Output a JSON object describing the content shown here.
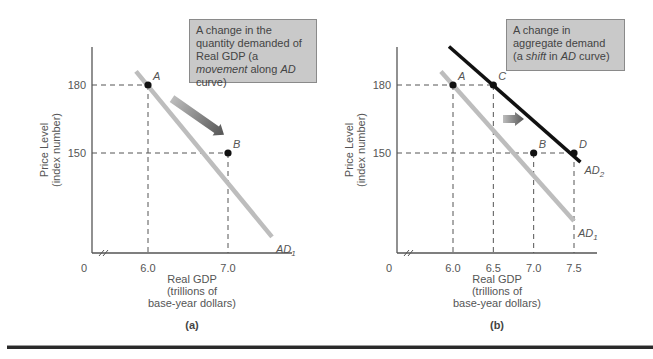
{
  "chart_data": [
    {
      "type": "line",
      "panel_label": "(a)",
      "annotation": {
        "pre": "A change in the quantity demanded of Real GDP (a ",
        "em": "movement",
        "mid": " along ",
        "em2": "AD",
        "post": " curve)"
      },
      "ylabel_line1": "Price Level",
      "ylabel_line2": "(index number)",
      "xlabel_line1": "Real GDP",
      "xlabel_line2": "(trillions of",
      "xlabel_line3": "base-year dollars)",
      "origin_label": "0",
      "x_ticks": [
        "6.0",
        "7.0"
      ],
      "x_tick_values": [
        6.0,
        7.0
      ],
      "y_ticks": [
        "180",
        "150"
      ],
      "y_tick_values": [
        180,
        150
      ],
      "series": [
        {
          "name": "AD1",
          "label_main": "AD",
          "label_sub": "1",
          "color": "#bdbdbd",
          "x": [
            5.85,
            7.55
          ],
          "y": [
            186,
            113
          ]
        }
      ],
      "points": [
        {
          "label": "A",
          "x": 6.0,
          "y": 180
        },
        {
          "label": "B",
          "x": 7.0,
          "y": 150
        }
      ],
      "arrow": {
        "from": [
          6.3,
          174
        ],
        "to": [
          6.95,
          158
        ],
        "color": "#666666",
        "meaning": "movement along AD curve"
      },
      "axis_break": true
    },
    {
      "type": "line",
      "panel_label": "(b)",
      "annotation": {
        "pre": "A change in aggregate demand (a ",
        "em": "shift",
        "mid": " in ",
        "em2": "AD",
        "post": " curve)"
      },
      "ylabel_line1": "Price Level",
      "ylabel_line2": "(index number)",
      "xlabel_line1": "Real GDP",
      "xlabel_line2": "(trillions of",
      "xlabel_line3": "base-year dollars)",
      "origin_label": "0",
      "x_ticks": [
        "6.0",
        "6.5",
        "7.0",
        "7.5"
      ],
      "x_tick_values": [
        6.0,
        6.5,
        7.0,
        7.5
      ],
      "y_ticks": [
        "180",
        "150"
      ],
      "y_tick_values": [
        180,
        150
      ],
      "series": [
        {
          "name": "AD1",
          "label_main": "AD",
          "label_sub": "1",
          "color": "#bdbdbd",
          "x": [
            5.85,
            7.5
          ],
          "y": [
            186,
            120
          ]
        },
        {
          "name": "AD2",
          "label_main": "AD",
          "label_sub": "2",
          "color": "#111111",
          "x": [
            5.95,
            7.58
          ],
          "y": [
            197,
            146
          ]
        }
      ],
      "points": [
        {
          "label": "A",
          "x": 6.0,
          "y": 180
        },
        {
          "label": "C",
          "x": 6.5,
          "y": 180
        },
        {
          "label": "B",
          "x": 7.0,
          "y": 150
        },
        {
          "label": "D",
          "x": 7.5,
          "y": 150
        }
      ],
      "arrow": {
        "from": [
          6.62,
          165
        ],
        "to": [
          6.88,
          165
        ],
        "color": "#666666",
        "meaning": "shift of AD curve to the right"
      },
      "axis_break": true
    }
  ]
}
